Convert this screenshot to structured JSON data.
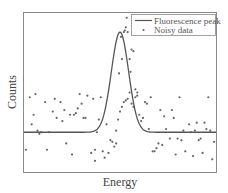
{
  "chart_data": {
    "type": "line+scatter",
    "title": "",
    "xlabel": "Energy",
    "ylabel": "Counts",
    "xticks": [],
    "yticks": [],
    "grid": false,
    "legend": {
      "position": "upper right",
      "entries": [
        {
          "label": "Fluorescence peak",
          "marker": "line"
        },
        {
          "label": "Noisy data",
          "marker": "dot"
        }
      ]
    },
    "xlim": [
      0,
      1
    ],
    "ylim": [
      0,
      1
    ],
    "series": [
      {
        "name": "Fluorescence peak",
        "kind": "gaussian",
        "baseline": 0.25,
        "amplitude": 0.63,
        "center": 0.5,
        "sigma": 0.045
      },
      {
        "name": "Noisy data",
        "kind": "scatter",
        "points": [
          [
            0.01,
            0.14
          ],
          [
            0.03,
            0.47
          ],
          [
            0.04,
            0.3
          ],
          [
            0.05,
            0.36
          ],
          [
            0.06,
            0.49
          ],
          [
            0.07,
            0.26
          ],
          [
            0.08,
            0.24
          ],
          [
            0.09,
            0.25
          ],
          [
            0.11,
            0.44
          ],
          [
            0.12,
            0.14
          ],
          [
            0.13,
            0.25
          ],
          [
            0.15,
            0.38
          ],
          [
            0.16,
            0.46
          ],
          [
            0.17,
            0.34
          ],
          [
            0.19,
            0.44
          ],
          [
            0.2,
            0.32
          ],
          [
            0.21,
            0.39
          ],
          [
            0.22,
            0.18
          ],
          [
            0.24,
            0.36
          ],
          [
            0.25,
            0.11
          ],
          [
            0.26,
            0.36
          ],
          [
            0.27,
            0.37
          ],
          [
            0.28,
            0.4
          ],
          [
            0.29,
            0.49
          ],
          [
            0.3,
            0.43
          ],
          [
            0.31,
            0.34
          ],
          [
            0.32,
            0.34
          ],
          [
            0.33,
            0.48
          ],
          [
            0.35,
            0.12
          ],
          [
            0.36,
            0.46
          ],
          [
            0.37,
            0.07
          ],
          [
            0.37,
            0.14
          ],
          [
            0.38,
            0.25
          ],
          [
            0.39,
            0.33
          ],
          [
            0.4,
            0.47
          ],
          [
            0.41,
            0.13
          ],
          [
            0.42,
            0.09
          ],
          [
            0.43,
            0.3
          ],
          [
            0.44,
            0.12
          ],
          [
            0.45,
            0.2
          ],
          [
            0.46,
            0.19
          ],
          [
            0.47,
            0.16
          ],
          [
            0.48,
            0.26
          ],
          [
            0.48,
            0.18
          ],
          [
            0.49,
            0.33
          ],
          [
            0.5,
            0.38
          ],
          [
            0.51,
            0.41
          ],
          [
            0.52,
            0.44
          ],
          [
            0.53,
            0.45
          ],
          [
            0.54,
            0.46
          ],
          [
            0.55,
            0.5
          ],
          [
            0.56,
            0.43
          ],
          [
            0.57,
            0.41
          ],
          [
            0.58,
            0.47
          ],
          [
            0.59,
            0.5
          ],
          [
            0.6,
            0.36
          ],
          [
            0.61,
            0.32
          ],
          [
            0.62,
            0.34
          ],
          [
            0.63,
            0.44
          ],
          [
            0.64,
            0.43
          ],
          [
            0.65,
            0.27
          ],
          [
            0.66,
            0.47
          ],
          [
            0.67,
            0.13
          ],
          [
            0.68,
            0.13
          ],
          [
            0.69,
            0.15
          ],
          [
            0.7,
            0.18
          ],
          [
            0.71,
            0.39
          ],
          [
            0.72,
            0.17
          ],
          [
            0.73,
            0.35
          ],
          [
            0.74,
            0.27
          ],
          [
            0.76,
            0.21
          ],
          [
            0.77,
            0.39
          ],
          [
            0.78,
            0.34
          ],
          [
            0.79,
            0.11
          ],
          [
            0.8,
            0.21
          ],
          [
            0.81,
            0.47
          ],
          [
            0.82,
            0.2
          ],
          [
            0.83,
            0.26
          ],
          [
            0.84,
            0.13
          ],
          [
            0.86,
            0.3
          ],
          [
            0.87,
            0.25
          ],
          [
            0.88,
            0.1
          ],
          [
            0.89,
            0.26
          ],
          [
            0.9,
            0.31
          ],
          [
            0.91,
            0.2
          ],
          [
            0.92,
            0.21
          ],
          [
            0.93,
            0.12
          ],
          [
            0.94,
            0.31
          ],
          [
            0.95,
            0.27
          ],
          [
            0.96,
            0.47
          ],
          [
            0.97,
            0.26
          ],
          [
            0.98,
            0.08
          ],
          [
            0.99,
            0.19
          ]
        ]
      }
    ],
    "peak_points": [
      [
        0.495,
        0.62
      ],
      [
        0.505,
        0.85
      ],
      [
        0.51,
        0.71
      ],
      [
        0.52,
        0.88
      ],
      [
        0.525,
        0.89
      ],
      [
        0.53,
        0.91
      ],
      [
        0.535,
        0.97
      ],
      [
        0.54,
        0.88
      ],
      [
        0.55,
        0.71
      ],
      [
        0.555,
        0.63
      ],
      [
        0.56,
        0.77
      ],
      [
        0.57,
        0.76
      ],
      [
        0.58,
        0.52
      ],
      [
        0.59,
        0.48
      ]
    ]
  }
}
